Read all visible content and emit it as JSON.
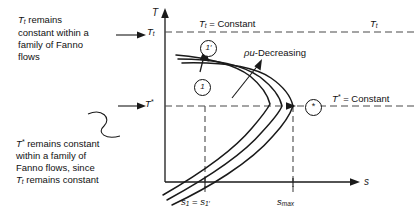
{
  "diagram": {
    "type": "T-s diagram of Fanno flow",
    "axes": {
      "y_label": "T",
      "x_label": "s",
      "y_tick_labels": [
        "T_t",
        "T*"
      ],
      "x_tick_labels": [
        "s_1 = s_1'",
        "s_max"
      ]
    },
    "annotations": {
      "left_top_note": "T_t remains constant within a family of Fanno flows",
      "left_top_note_lines": [
        "remains",
        "constant within a",
        "family of Fanno",
        "flows"
      ],
      "left_bottom_note": "T* remains constant within a family of Fanno flows, since T_t remains constant",
      "left_bottom_note_lines": [
        "remains constant",
        "within a family of",
        "Fanno flows, since",
        "remains constant"
      ],
      "top_dashed_label": "= Constant",
      "top_dashed_right_label": "T",
      "mid_dashed_label": "= Constant",
      "rho_u_label": "-Decreasing",
      "rho_u_symbol": "ρu"
    },
    "state_points": [
      {
        "name": "point-1-prime",
        "label": "1′"
      },
      {
        "name": "point-1",
        "label": "1"
      },
      {
        "name": "point-sonic",
        "label": "*"
      }
    ],
    "symbols": {
      "T": "T",
      "T_sub_t": "t",
      "T_star_sup": "*",
      "s": "s",
      "s_sub_1": "1",
      "s_sub_1_prime": "1′",
      "s_sub_max": "max",
      "equals": "="
    },
    "colors": {
      "line": "#1a1a1a",
      "dashed": "#4a4a4a",
      "background": "#ffffff",
      "text": "#111111"
    }
  }
}
